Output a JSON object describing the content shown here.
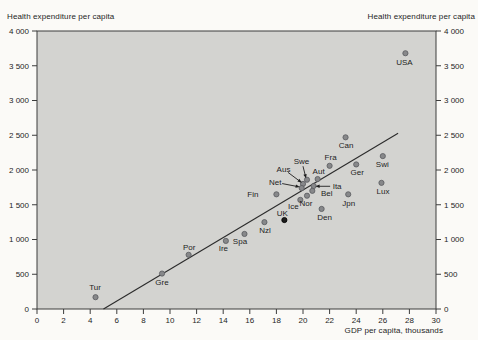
{
  "chart_data": {
    "type": "scatter",
    "title": "",
    "ylabel_left": "Health expenditure per capita",
    "ylabel_right": "Health expenditure per capita",
    "xlabel": "GDP per capita, thousands",
    "xlim": [
      0,
      30
    ],
    "ylim": [
      0,
      4000
    ],
    "grid": false,
    "legend": "none",
    "plot_bg": "#d3d3d0",
    "frame_color": "#3c3c3c",
    "text_color": "#1e1e1e",
    "point_color": "#87888a",
    "point_edge": "#595b5e",
    "highlight_point_color": "#1c1c1c",
    "trend_color": "#2b2b2b",
    "xticks": [
      0,
      2,
      4,
      6,
      8,
      10,
      12,
      14,
      16,
      18,
      20,
      22,
      24,
      26,
      28,
      30
    ],
    "xtick_labels": [
      "0",
      "2",
      "4",
      "6",
      "8",
      "10",
      "12",
      "14",
      "16",
      "18",
      "20",
      "22",
      "24",
      "26",
      "28",
      "30"
    ],
    "yticks": [
      0,
      500,
      1000,
      1500,
      2000,
      2500,
      3000,
      3500,
      4000
    ],
    "ytick_labels": [
      "0",
      "500",
      "1 000",
      "1 500",
      "2 000",
      "2 500",
      "3 000",
      "3 500",
      "4 000"
    ],
    "trend_line": {
      "x1": 5.0,
      "y1": 0,
      "x2": 27.15,
      "y2": 2530
    },
    "points": [
      {
        "label": "USA",
        "x": 27.7,
        "y": 3680,
        "ldx": -1,
        "ldy": 9
      },
      {
        "label": "Can",
        "x": 23.2,
        "y": 2470,
        "ldx": 0.5,
        "ldy": 8
      },
      {
        "label": "Swi",
        "x": 26.0,
        "y": 2200,
        "ldx": -0.5,
        "ldy": 8
      },
      {
        "label": "Ger",
        "x": 24.0,
        "y": 2080,
        "ldx": 1,
        "ldy": 8
      },
      {
        "label": "Fra",
        "x": 22.0,
        "y": 2060,
        "ldx": 1,
        "ldy": -9
      },
      {
        "label": "Aut",
        "x": 21.1,
        "y": 1870,
        "ldx": 1,
        "ldy": -7.5
      },
      {
        "label": "Swe",
        "x": 20.3,
        "y": 1860,
        "ldx": -5.5,
        "ldy": -18.5,
        "arrow": {
          "sdx": -4,
          "sdy": -13.5,
          "edx": -1.5,
          "edy": -3.5
        }
      },
      {
        "label": "Lux",
        "x": 25.9,
        "y": 1815,
        "ldx": 1.5,
        "ldy": 8
      },
      {
        "label": "Aus",
        "x": 20.0,
        "y": 1800,
        "ldx": -19.5,
        "ldy": -15,
        "arrow": {
          "sdx": -15,
          "sdy": -11.5,
          "edx": -3,
          "edy": -2.5
        }
      },
      {
        "label": "Ita",
        "x": 20.8,
        "y": 1770,
        "ldx": 23.5,
        "ldy": 0,
        "arrow": {
          "sdx": 16.5,
          "sdy": 0.3,
          "edx": 4,
          "edy": 0.3
        }
      },
      {
        "label": "Net",
        "x": 19.9,
        "y": 1740,
        "ldx": -26.5,
        "ldy": -6,
        "arrow": {
          "sdx": -19.5,
          "sdy": -4.5,
          "edx": -4,
          "edy": -1.5
        }
      },
      {
        "label": "Bel",
        "x": 20.7,
        "y": 1700,
        "ldx": 14.5,
        "ldy": 2
      },
      {
        "label": "Jpn",
        "x": 23.4,
        "y": 1650,
        "ldx": 0.5,
        "ldy": 9
      },
      {
        "label": "Fin",
        "x": 18.0,
        "y": 1650,
        "ldx": -23.5,
        "ldy": 0
      },
      {
        "label": "Nor",
        "x": 20.3,
        "y": 1630,
        "ldx": -1,
        "ldy": 7
      },
      {
        "label": "Ice",
        "x": 19.8,
        "y": 1570,
        "ldx": -7,
        "ldy": 6.5
      },
      {
        "label": "Den",
        "x": 21.4,
        "y": 1440,
        "ldx": 3,
        "ldy": 8.5
      },
      {
        "label": "UK",
        "x": 18.6,
        "y": 1280,
        "dark": true,
        "ldx": -2,
        "ldy": -7
      },
      {
        "label": "Nzl",
        "x": 17.1,
        "y": 1250,
        "ldx": 0.5,
        "ldy": 8
      },
      {
        "label": "Spa",
        "x": 15.6,
        "y": 1080,
        "ldx": -4.5,
        "ldy": 7.5
      },
      {
        "label": "Ire",
        "x": 14.2,
        "y": 980,
        "ldx": -2.5,
        "ldy": 7
      },
      {
        "label": "Por",
        "x": 11.4,
        "y": 780,
        "ldx": 0.5,
        "ldy": -8
      },
      {
        "label": "Gre",
        "x": 9.4,
        "y": 510,
        "ldx": 0,
        "ldy": 9
      },
      {
        "label": "Tur",
        "x": 4.4,
        "y": 170,
        "ldx": -0.5,
        "ldy": -9.5
      }
    ]
  }
}
